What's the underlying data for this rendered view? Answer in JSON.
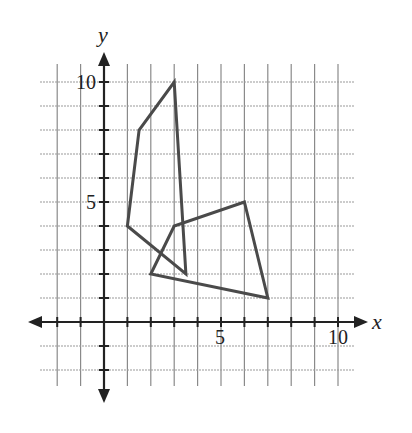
{
  "chart_data": {
    "type": "line",
    "title": "",
    "xlabel": "x",
    "ylabel": "y",
    "xlim": [
      -3,
      11
    ],
    "ylim": [
      -3,
      10
    ],
    "grid": true,
    "x_tick_labels": [
      "5",
      "10"
    ],
    "y_tick_labels": [
      "5",
      "10"
    ],
    "series": [
      {
        "name": "quadrilateral-1",
        "closed": true,
        "points": [
          [
            1,
            4
          ],
          [
            1.5,
            8
          ],
          [
            3,
            10
          ],
          [
            3.5,
            2
          ]
        ]
      },
      {
        "name": "quadrilateral-2",
        "closed": true,
        "points": [
          [
            2,
            2
          ],
          [
            3,
            4
          ],
          [
            6,
            5
          ],
          [
            7,
            1
          ]
        ]
      }
    ],
    "colors": {
      "grid": "#8a8a8a",
      "axis": "#222222",
      "shape": "#4a4a4a"
    }
  },
  "labels": {
    "x_axis": "x",
    "y_axis": "y",
    "x5": "5",
    "x10": "10",
    "y5": "5",
    "y10": "10"
  }
}
